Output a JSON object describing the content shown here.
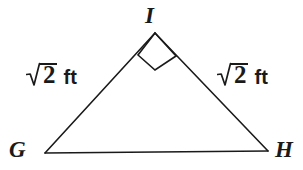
{
  "figure": {
    "kind": "geometry-diagram",
    "shape": "triangle",
    "background_color": "#ffffff",
    "stroke_color": "#1a1a1a",
    "text_color": "#1a1a1a",
    "stroke_width": 1.6
  },
  "vertices": {
    "apex": {
      "name": "I",
      "x": 155,
      "y": 33
    },
    "bottom_left": {
      "name": "G",
      "x": 45,
      "y": 153
    },
    "bottom_right": {
      "name": "H",
      "x": 268,
      "y": 151
    }
  },
  "labels": {
    "apex_label": "I",
    "bottom_left_label": "G",
    "bottom_right_label": "H"
  },
  "sides": {
    "left_leg": {
      "from": "G",
      "to": "I",
      "radical_symbol": "√",
      "radicand": "2",
      "unit": "ft",
      "full_text": "√2 ft"
    },
    "right_leg": {
      "from": "I",
      "to": "H",
      "radical_symbol": "√",
      "radicand": "2",
      "unit": "ft",
      "full_text": "√2 ft"
    },
    "base": {
      "from": "G",
      "to": "H",
      "full_text": ""
    }
  },
  "angle_markers": [
    {
      "at_vertex": "I",
      "type": "right-angle",
      "glyph": "rotated-square",
      "measure_degrees": 90
    }
  ]
}
